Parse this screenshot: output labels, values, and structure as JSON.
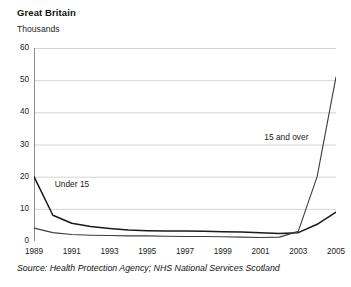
{
  "header": {
    "title": "Great Britain",
    "units_label": "Thousands"
  },
  "footer": {
    "source": "Source: Health Protection Agency; NHS National Services Scotland"
  },
  "chart_data": {
    "type": "line",
    "title": "Great Britain",
    "subtitle": "Thousands",
    "xlabel": "",
    "ylabel": "Thousands",
    "ylim": [
      0,
      60
    ],
    "xlim": [
      1989,
      2005
    ],
    "yticks": [
      0,
      10,
      20,
      30,
      40,
      50,
      60
    ],
    "xticks": [
      1989,
      1991,
      1993,
      1995,
      1997,
      1999,
      2001,
      2003,
      2005
    ],
    "grid": "horizontal",
    "legend_position": "inline-annotations",
    "x": [
      1989,
      1990,
      1991,
      1992,
      1993,
      1994,
      1995,
      1996,
      1997,
      1998,
      1999,
      2000,
      2001,
      2002,
      2003,
      2004,
      2005
    ],
    "series": [
      {
        "name": "Under 15",
        "color": "#1a1a1a",
        "label_x": 1990.1,
        "label_y": 17.5,
        "values": [
          20.0,
          8.0,
          5.5,
          4.5,
          3.9,
          3.4,
          3.2,
          3.1,
          3.1,
          3.0,
          2.9,
          2.8,
          2.6,
          2.3,
          2.6,
          5.2,
          9.0
        ]
      },
      {
        "name": "15 and over",
        "color": "#3d3d3d",
        "label_x": 2001.2,
        "label_y": 32.0,
        "values": [
          4.0,
          2.6,
          2.0,
          1.8,
          1.7,
          1.6,
          1.6,
          1.5,
          1.4,
          1.4,
          1.3,
          1.2,
          1.1,
          1.2,
          3.0,
          20.0,
          51.0
        ]
      }
    ],
    "annotations": [
      {
        "text": "Under 15",
        "x": 1990.1,
        "y": 17.5
      },
      {
        "text": "15 and over",
        "x": 2001.2,
        "y": 32.0
      }
    ]
  },
  "axis": {
    "y_labels": [
      "60",
      "50",
      "40",
      "30",
      "20",
      "10",
      "0"
    ],
    "x_labels": [
      "1989",
      "1991",
      "1993",
      "1995",
      "1997",
      "1999",
      "2001",
      "2003",
      "2005"
    ]
  }
}
